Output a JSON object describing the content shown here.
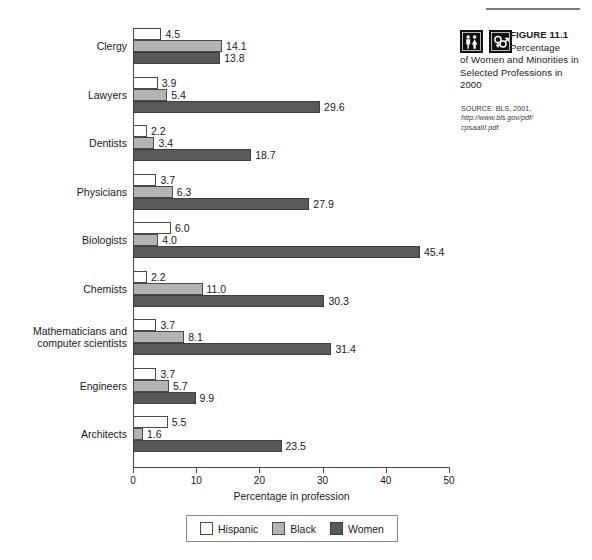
{
  "figure": {
    "top_rule": true,
    "label": "FIGURE 11.1",
    "title_lead": "Percentage",
    "title_rest": "of Women and\nMinorities in Selected\nProfessions in 2000",
    "source_line1": "SOURCE: BLS, 2001,",
    "source_url_line1": "http://www.bls.gov/pdf/",
    "source_url_line2": "cpsaatII.pdf.",
    "icons": [
      {
        "name": "male-female-figures-icon"
      },
      {
        "name": "gender-symbols-icon"
      }
    ]
  },
  "chart_data": {
    "type": "bar",
    "orientation": "horizontal",
    "title": "",
    "xlabel": "Percentage in profession",
    "ylabel": "",
    "xlim": [
      0,
      50
    ],
    "xticks": [
      0,
      10,
      20,
      30,
      40,
      50
    ],
    "xtick_labels": [
      "0",
      "10",
      "20",
      "30",
      "40",
      "50"
    ],
    "grid": false,
    "legend_position": "bottom",
    "categories": [
      "Clergy",
      "Lawyers",
      "Dentists",
      "Physicians",
      "Biologists",
      "Chemists",
      "Mathematicians and\ncomputer scientists",
      "Engineers",
      "Architects"
    ],
    "series": [
      {
        "name": "Hispanic",
        "color": "#ffffff",
        "values": [
          4.5,
          3.9,
          2.2,
          3.7,
          6.0,
          2.2,
          3.7,
          3.7,
          5.5
        ],
        "labels": [
          "4.5",
          "3.9",
          "2.2",
          "3.7",
          "6.0",
          "2.2",
          "3.7",
          "3.7",
          "5.5"
        ]
      },
      {
        "name": "Black",
        "color": "#b3b3b3",
        "values": [
          14.1,
          5.4,
          3.4,
          6.3,
          4.0,
          11.0,
          8.1,
          5.7,
          1.6
        ],
        "labels": [
          "14.1",
          "5.4",
          "3.4",
          "6.3",
          "4.0",
          "11.0",
          "8.1",
          "5.7",
          "1.6"
        ]
      },
      {
        "name": "Women",
        "color": "#595959",
        "values": [
          13.8,
          29.6,
          18.7,
          27.9,
          45.4,
          30.3,
          31.4,
          9.9,
          23.5
        ],
        "labels": [
          "13.8",
          "29.6",
          "18.7",
          "27.9",
          "45.4",
          "30.3",
          "31.4",
          "9.9",
          "23.5"
        ]
      }
    ]
  },
  "legend": {
    "items": [
      {
        "label": "Hispanic",
        "swatch": "hispanic"
      },
      {
        "label": "Black",
        "swatch": "black"
      },
      {
        "label": "Women",
        "swatch": "women"
      }
    ]
  }
}
